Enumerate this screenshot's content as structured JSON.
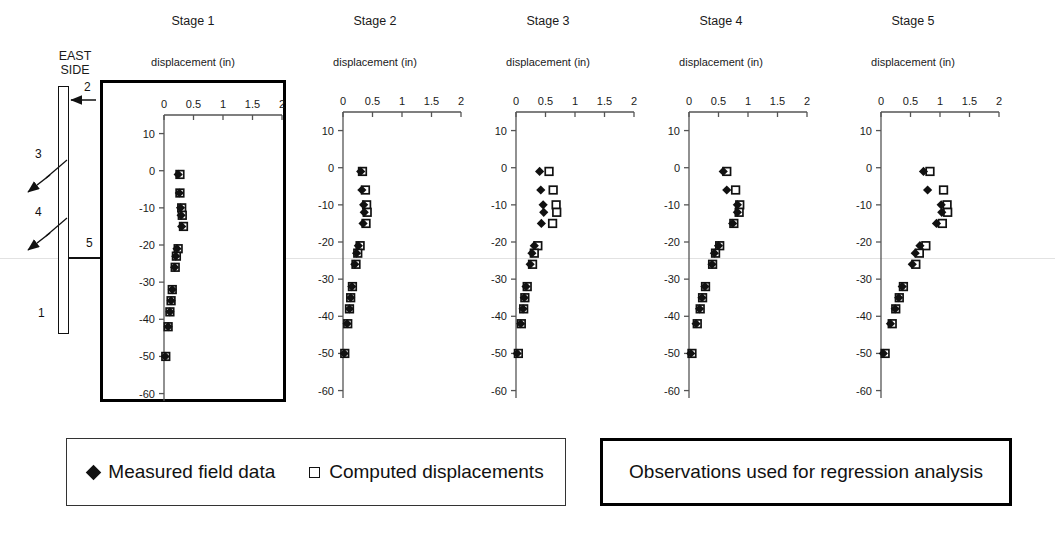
{
  "schematic": {
    "title_line1": "EAST",
    "title_line2": "SIDE",
    "labels": [
      {
        "id": "1",
        "text": "1"
      },
      {
        "id": "2",
        "text": "2"
      },
      {
        "id": "3",
        "text": "3"
      },
      {
        "id": "4",
        "text": "4"
      },
      {
        "id": "5",
        "text": "5"
      }
    ]
  },
  "axes": {
    "xlabel": "displacement (in)",
    "ylabel": "Elevation (ft CCD)",
    "xticks": [
      "0",
      "0.5",
      "1",
      "1.5",
      "2"
    ],
    "yticks": [
      "10",
      "0",
      "-10",
      "-20",
      "-30",
      "-40",
      "-50",
      "-60"
    ],
    "xlim": [
      0,
      2
    ],
    "ylim": [
      -60,
      15
    ]
  },
  "legend": {
    "measured_label": "Measured field data",
    "computed_label": "Computed displacements",
    "measured_symbol": "filled-diamond",
    "computed_symbol": "open-square"
  },
  "observations_note": "Observations used for regression analysis",
  "colors": {
    "ink": "#111111",
    "axis": "#555555",
    "box_highlight": "#000000"
  },
  "chart_data": {
    "type": "scatter",
    "xlabel": "displacement (in)",
    "ylabel": "Elevation (ft CCD)",
    "xlim": [
      0,
      2
    ],
    "ylim": [
      -60,
      15
    ],
    "xticks": [
      0,
      0.5,
      1,
      1.5,
      2
    ],
    "yticks": [
      10,
      0,
      -10,
      -20,
      -30,
      -40,
      -50,
      -60
    ],
    "grid": false,
    "legend_position": "below-figure",
    "elevations": [
      -1,
      -6,
      -10,
      -12,
      -15,
      -21,
      -23,
      -26,
      -32,
      -35,
      -38,
      -42,
      -50
    ],
    "panels": [
      {
        "title": "Stage 1",
        "highlighted": true,
        "series": [
          {
            "name": "Measured field data",
            "symbol": "filled-diamond",
            "values": [
              0.24,
              0.26,
              0.28,
              0.29,
              0.3,
              0.22,
              0.2,
              0.18,
              0.14,
              0.12,
              0.1,
              0.07,
              0.02
            ]
          },
          {
            "name": "Computed displacements",
            "symbol": "open-square",
            "values": [
              0.27,
              0.27,
              0.3,
              0.31,
              0.33,
              0.24,
              0.21,
              0.19,
              0.14,
              0.12,
              0.1,
              0.07,
              0.03
            ]
          }
        ]
      },
      {
        "title": "Stage 2",
        "highlighted": false,
        "series": [
          {
            "name": "Measured field data",
            "symbol": "filled-diamond",
            "values": [
              0.3,
              0.32,
              0.35,
              0.36,
              0.34,
              0.26,
              0.23,
              0.2,
              0.15,
              0.13,
              0.11,
              0.07,
              0.02
            ]
          },
          {
            "name": "Computed displacements",
            "symbol": "open-square",
            "values": [
              0.33,
              0.38,
              0.4,
              0.41,
              0.39,
              0.29,
              0.25,
              0.22,
              0.16,
              0.13,
              0.11,
              0.08,
              0.03
            ]
          }
        ]
      },
      {
        "title": "Stage 3",
        "highlighted": false,
        "series": [
          {
            "name": "Measured field data",
            "symbol": "filled-diamond",
            "values": [
              0.4,
              0.42,
              0.46,
              0.47,
              0.43,
              0.31,
              0.27,
              0.24,
              0.17,
              0.14,
              0.12,
              0.08,
              0.02
            ]
          },
          {
            "name": "Computed displacements",
            "symbol": "open-square",
            "values": [
              0.56,
              0.63,
              0.68,
              0.69,
              0.62,
              0.37,
              0.31,
              0.28,
              0.19,
              0.15,
              0.13,
              0.09,
              0.04
            ]
          }
        ]
      },
      {
        "title": "Stage 4",
        "highlighted": false,
        "series": [
          {
            "name": "Measured field data",
            "symbol": "filled-diamond",
            "values": [
              0.58,
              0.64,
              0.82,
              0.82,
              0.74,
              0.5,
              0.43,
              0.39,
              0.27,
              0.22,
              0.18,
              0.12,
              0.03
            ]
          },
          {
            "name": "Computed displacements",
            "symbol": "open-square",
            "values": [
              0.64,
              0.79,
              0.86,
              0.85,
              0.76,
              0.52,
              0.45,
              0.4,
              0.28,
              0.23,
              0.19,
              0.14,
              0.05
            ]
          }
        ]
      },
      {
        "title": "Stage 5",
        "highlighted": false,
        "series": [
          {
            "name": "Measured field data",
            "symbol": "filled-diamond",
            "values": [
              0.72,
              0.79,
              1.02,
              1.03,
              0.94,
              0.66,
              0.58,
              0.53,
              0.36,
              0.3,
              0.24,
              0.16,
              0.04
            ]
          },
          {
            "name": "Computed displacements",
            "symbol": "open-square",
            "values": [
              0.83,
              1.06,
              1.12,
              1.13,
              1.04,
              0.76,
              0.65,
              0.59,
              0.38,
              0.31,
              0.25,
              0.19,
              0.07
            ]
          }
        ]
      }
    ]
  }
}
